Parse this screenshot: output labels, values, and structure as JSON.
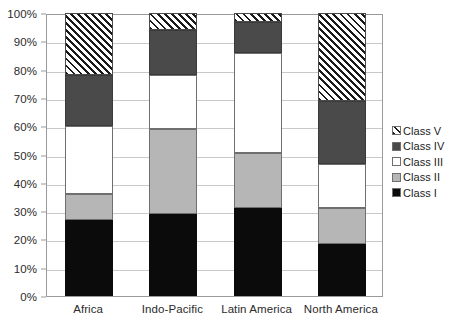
{
  "chart_data": {
    "type": "bar",
    "subtype": "stacked-percentage-column",
    "title": "",
    "xlabel": "",
    "ylabel": "",
    "ylim": [
      0,
      100
    ],
    "y_unit": "%",
    "grid": true,
    "legend_position": "right",
    "categories": [
      "Africa",
      "Indo-Pacific",
      "Latin America",
      "North America"
    ],
    "y_ticks": [
      "0%",
      "10%",
      "20%",
      "30%",
      "40%",
      "50%",
      "60%",
      "70%",
      "80%",
      "90%",
      "100%"
    ],
    "y_tick_values": [
      0,
      10,
      20,
      30,
      40,
      50,
      60,
      70,
      80,
      90,
      100
    ],
    "series": [
      {
        "name": "Class I",
        "key": "class1",
        "fill": "solid-black",
        "color": "#0b0b0b",
        "values": [
          27,
          29,
          31,
          18.5
        ]
      },
      {
        "name": "Class II",
        "key": "class2",
        "fill": "solid-light-gray",
        "color": "#b6b6b6",
        "values": [
          9,
          30,
          19.5,
          12.5
        ]
      },
      {
        "name": "Class III",
        "key": "class3",
        "fill": "solid-white",
        "color": "#ffffff",
        "values": [
          24,
          19,
          35.5,
          15.5
        ]
      },
      {
        "name": "Class IV",
        "key": "class4",
        "fill": "solid-dark-gray",
        "color": "#4a4a4a",
        "values": [
          18,
          16,
          11,
          22.5
        ]
      },
      {
        "name": "Class V",
        "key": "class5",
        "fill": "diagonal-hatch",
        "color": "#1a1a1a",
        "values": [
          22,
          6,
          3,
          31
        ]
      }
    ],
    "cumulative_tops": {
      "Africa": {
        "class1": 27,
        "class2": 36,
        "class3": 60,
        "class4": 78,
        "class5": 100
      },
      "Indo-Pacific": {
        "class1": 29,
        "class2": 59,
        "class3": 78,
        "class4": 94,
        "class5": 100
      },
      "Latin America": {
        "class1": 31,
        "class2": 50.5,
        "class3": 86,
        "class4": 97,
        "class5": 100
      },
      "North America": {
        "class1": 18.5,
        "class2": 31,
        "class3": 46.5,
        "class4": 69,
        "class5": 100
      }
    }
  },
  "legend": {
    "items": [
      {
        "label": "Class V",
        "key": "class5"
      },
      {
        "label": "Class IV",
        "key": "class4"
      },
      {
        "label": "Class III",
        "key": "class3"
      },
      {
        "label": "Class II",
        "key": "class2"
      },
      {
        "label": "Class I",
        "key": "class1"
      }
    ]
  },
  "colors": {
    "class1": "#0b0b0b",
    "class2": "#b6b6b6",
    "class3": "#ffffff",
    "class4": "#4a4a4a",
    "class5_hatch": "#1a1a1a",
    "gridline": "#c9c9c9",
    "axis": "#9a9a9a",
    "text": "#2b2b2b",
    "background": "#ffffff"
  }
}
